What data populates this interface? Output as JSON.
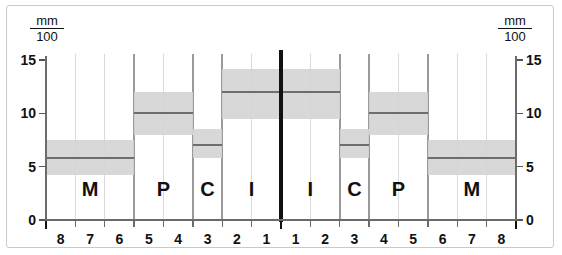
{
  "chart_data": {
    "type": "bar",
    "title": "",
    "subtitle": "",
    "xlabel": "",
    "ylabel": "mm/100",
    "unit_numerator": "mm",
    "unit_denominator": "100",
    "ylim": [
      0,
      15
    ],
    "y_ticks": [
      0,
      5,
      10,
      15
    ],
    "y_tick_labels": [
      "0",
      "5",
      "10",
      "15"
    ],
    "grid": true,
    "legend": "none",
    "symmetry": "mirrored left/right quadrants separated by a vertical midline",
    "x_categories_left": [
      "8",
      "7",
      "6",
      "5",
      "4",
      "3",
      "2",
      "1"
    ],
    "x_categories_right": [
      "1",
      "2",
      "3",
      "4",
      "5",
      "6",
      "7",
      "8"
    ],
    "x_tick_labels": [
      "8",
      "7",
      "6",
      "5",
      "4",
      "3",
      "2",
      "1",
      "1",
      "2",
      "3",
      "4",
      "5",
      "6",
      "7",
      "8"
    ],
    "group_labels": [
      "M",
      "P",
      "C",
      "I",
      "I",
      "C",
      "P",
      "M"
    ],
    "series": [
      {
        "name": "median",
        "values": [
          5.8,
          5.8,
          5.8,
          10.0,
          10.0,
          7.0,
          12.0,
          12.0,
          12.0,
          12.0,
          7.0,
          10.0,
          10.0,
          5.8,
          5.8,
          5.8
        ]
      },
      {
        "name": "band_upper",
        "values": [
          7.5,
          7.5,
          7.5,
          12.0,
          12.0,
          8.5,
          14.2,
          14.2,
          14.2,
          14.2,
          8.5,
          12.0,
          12.0,
          7.5,
          7.5,
          7.5
        ]
      },
      {
        "name": "band_lower",
        "values": [
          4.2,
          4.2,
          4.2,
          8.0,
          8.0,
          5.8,
          9.5,
          9.5,
          9.5,
          9.5,
          5.8,
          8.0,
          8.0,
          4.2,
          4.2,
          4.2
        ]
      }
    ],
    "groups": [
      {
        "label": "M",
        "side": "left",
        "teeth": [
          "8",
          "7",
          "6"
        ],
        "median": 5.8,
        "upper": 7.5,
        "lower": 4.2
      },
      {
        "label": "P",
        "side": "left",
        "teeth": [
          "5",
          "4"
        ],
        "median": 10.0,
        "upper": 12.0,
        "lower": 8.0
      },
      {
        "label": "C",
        "side": "left",
        "teeth": [
          "3"
        ],
        "median": 7.0,
        "upper": 8.5,
        "lower": 5.8
      },
      {
        "label": "I",
        "side": "left",
        "teeth": [
          "2",
          "1"
        ],
        "median": 12.0,
        "upper": 14.2,
        "lower": 9.5
      },
      {
        "label": "I",
        "side": "right",
        "teeth": [
          "1",
          "2"
        ],
        "median": 12.0,
        "upper": 14.2,
        "lower": 9.5
      },
      {
        "label": "C",
        "side": "right",
        "teeth": [
          "3"
        ],
        "median": 7.0,
        "upper": 8.5,
        "lower": 5.8
      },
      {
        "label": "P",
        "side": "right",
        "teeth": [
          "4",
          "5"
        ],
        "median": 10.0,
        "upper": 12.0,
        "lower": 8.0
      },
      {
        "label": "M",
        "side": "right",
        "teeth": [
          "6",
          "7",
          "8"
        ],
        "median": 5.8,
        "upper": 7.5,
        "lower": 4.2
      }
    ],
    "colors": {
      "band": "#d5d5d5",
      "median": "#6e6e6e",
      "grid": "#d9d9d9",
      "axis": "#6b6b6b",
      "midline": "#111111",
      "frame": "#c9c9c9",
      "text": "#111111",
      "background": "#ffffff"
    }
  },
  "axis_left": {
    "unit_num": "mm",
    "unit_den": "100"
  },
  "axis_right": {
    "unit_num": "mm",
    "unit_den": "100"
  }
}
